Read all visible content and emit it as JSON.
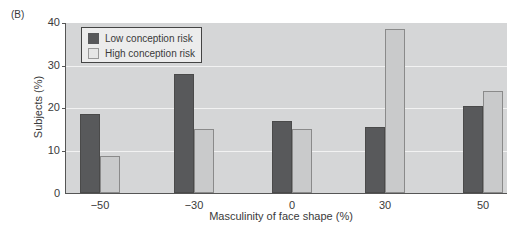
{
  "panel_label": "(B)",
  "chart_data": {
    "type": "bar",
    "title": "",
    "xlabel": "Masculinity of face shape (%)",
    "ylabel": "Subjects (%)",
    "ylim": [
      0,
      40
    ],
    "yticks": [
      0,
      10,
      20,
      30,
      40
    ],
    "grid": true,
    "legend_position": "upper left",
    "categories": [
      "−50",
      "−30",
      "0",
      "30",
      "50"
    ],
    "series": [
      {
        "name": "Low conception risk",
        "color": "#58595b",
        "values": [
          18.5,
          28,
          17,
          15.5,
          20.5
        ]
      },
      {
        "name": "High conception risk",
        "color": "#c9cacb",
        "values": [
          8.7,
          15,
          15,
          38.5,
          24
        ]
      }
    ]
  },
  "legend": {
    "items": [
      {
        "label": "Low conception risk"
      },
      {
        "label": "High conception risk"
      }
    ]
  },
  "axes": {
    "y_tick_labels": [
      "0",
      "10",
      "20",
      "30",
      "40"
    ],
    "x_tick_labels": [
      "−50",
      "−30",
      "0",
      "30",
      "50"
    ]
  }
}
